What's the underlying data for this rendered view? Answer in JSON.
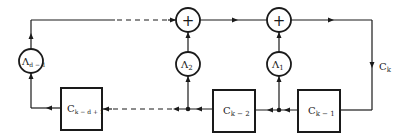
{
  "diagram": {
    "type": "shift-register feedback block diagram",
    "adders": [
      {
        "id": "adder-left",
        "symbol": "+"
      },
      {
        "id": "adder-right",
        "symbol": "+"
      }
    ],
    "multipliers": [
      {
        "id": "lambda-1",
        "base": "Λ",
        "sub": "1"
      },
      {
        "id": "lambda-2",
        "base": "Λ",
        "sub": "2"
      },
      {
        "id": "lambda-d-1",
        "base": "Λ",
        "sub": "d − 1"
      }
    ],
    "registers": [
      {
        "id": "c-k-1",
        "base": "C",
        "sub": "k − 1"
      },
      {
        "id": "c-k-2",
        "base": "C",
        "sub": "k − 2"
      },
      {
        "id": "c-k-d-1",
        "base": "C",
        "sub": "k − d + 1"
      }
    ],
    "output_label": {
      "base": "C",
      "sub": "k"
    }
  }
}
